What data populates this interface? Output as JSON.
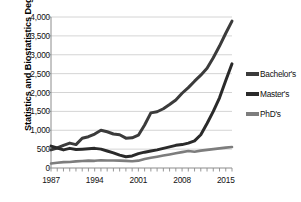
{
  "chart_data": {
    "type": "line",
    "title": "",
    "xlabel": "",
    "ylabel": "Statistics and Biostatistics Degrees",
    "xlim": [
      1987,
      2016
    ],
    "ylim": [
      0,
      4000
    ],
    "grid": true,
    "legend_position": "right",
    "y_ticks": [
      "0",
      "500",
      "1,000",
      "1,500",
      "2,000",
      "2,500",
      "3,000",
      "3,500",
      "4,000"
    ],
    "y_tick_values": [
      0,
      500,
      1000,
      1500,
      2000,
      2500,
      3000,
      3500,
      4000
    ],
    "x_ticks": [
      "1987",
      "1994",
      "2001",
      "2008",
      "2015"
    ],
    "x_tick_values": [
      1987,
      1994,
      2001,
      2008,
      2015
    ],
    "x": [
      1987,
      1988,
      1989,
      1990,
      1991,
      1992,
      1993,
      1994,
      1995,
      1996,
      1997,
      1998,
      1999,
      2000,
      2001,
      2002,
      2003,
      2004,
      2005,
      2006,
      2007,
      2008,
      2009,
      2010,
      2011,
      2012,
      2013,
      2014,
      2015,
      2016
    ],
    "series": [
      {
        "name": "Bachelor's",
        "color": "#3b3b3b",
        "values": [
          480,
          530,
          600,
          660,
          620,
          790,
          830,
          900,
          1000,
          960,
          900,
          880,
          790,
          800,
          870,
          1140,
          1460,
          1490,
          1570,
          1680,
          1800,
          1980,
          2130,
          2300,
          2460,
          2640,
          2920,
          3230,
          3570,
          3890
        ]
      },
      {
        "name": "Master's",
        "color": "#2a2a2a",
        "values": [
          580,
          530,
          480,
          520,
          490,
          500,
          510,
          520,
          500,
          450,
          400,
          340,
          300,
          320,
          380,
          420,
          450,
          480,
          520,
          560,
          600,
          620,
          660,
          720,
          880,
          1180,
          1500,
          1860,
          2320,
          2760
        ]
      },
      {
        "name": "PhD's",
        "color": "#7d7d7d",
        "values": [
          120,
          140,
          155,
          160,
          175,
          185,
          195,
          190,
          205,
          200,
          200,
          195,
          190,
          180,
          195,
          240,
          270,
          300,
          330,
          360,
          390,
          420,
          450,
          430,
          460,
          480,
          500,
          520,
          540,
          555
        ]
      }
    ]
  },
  "legend": {
    "items": [
      {
        "label": "Bachelor's"
      },
      {
        "label": "Master's"
      },
      {
        "label": "PhD's"
      }
    ]
  },
  "axes": {
    "y_axis_title": "Statistics and Biostatistics Degrees"
  }
}
